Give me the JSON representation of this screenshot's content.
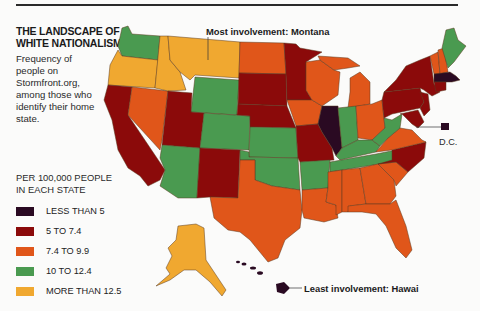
{
  "header": {
    "title_line1": "THE LANDSCAPE OF",
    "title_line2": "WHITE NATIONALISM",
    "subtitle": "Frequency of people on Stormfront.org, among those who identify their home state."
  },
  "legend": {
    "heading_line1": "PER 100,000 PEOPLE",
    "heading_line2": "IN EACH STATE",
    "items": [
      {
        "label": "LESS THAN 5",
        "color": "#2a0a22"
      },
      {
        "label": "5 TO 7.4",
        "color": "#8b0a0a"
      },
      {
        "label": "7.4 TO 9.9",
        "color": "#e0561a"
      },
      {
        "label": "10 TO 12.4",
        "color": "#4a9a50"
      },
      {
        "label": "MORE THAN 12.5",
        "color": "#f0a830"
      }
    ]
  },
  "annotations": {
    "most": "Most involvement: Montana",
    "least": "Least involvement: Hawai",
    "dc": "D.C."
  },
  "colors": {
    "lt5": "#2a0a22",
    "c5_7": "#8b0a0a",
    "c7_9": "#e0561a",
    "c10_12": "#4a9a50",
    "gt12": "#f0a830"
  },
  "states": {
    "WA": "10 TO 12.4",
    "OR": "MORE THAN 12.5",
    "CA": "5 TO 7.4",
    "NV": "7.4 TO 9.9",
    "ID": "MORE THAN 12.5",
    "MT": "MORE THAN 12.5",
    "WY": "10 TO 12.4",
    "UT": "5 TO 7.4",
    "AZ": "10 TO 12.4",
    "CO": "10 TO 12.4",
    "NM": "5 TO 7.4",
    "ND": "7.4 TO 9.9",
    "SD": "5 TO 7.4",
    "NE": "5 TO 7.4",
    "KS": "10 TO 12.4",
    "OK": "10 TO 12.4",
    "TX": "7.4 TO 9.9",
    "MN": "5 TO 7.4",
    "IA": "7.4 TO 9.9",
    "MO": "5 TO 7.4",
    "AR": "10 TO 12.4",
    "LA": "7.4 TO 9.9",
    "WI": "7.4 TO 9.9",
    "IL": "LESS THAN 5",
    "MI": "7.4 TO 9.9",
    "IN": "10 TO 12.4",
    "OH": "7.4 TO 9.9",
    "KY": "10 TO 12.4",
    "TN": "10 TO 12.4",
    "MS": "7.4 TO 9.9",
    "AL": "7.4 TO 9.9",
    "GA": "7.4 TO 9.9",
    "FL": "7.4 TO 9.9",
    "SC": "7.4 TO 9.9",
    "NC": "5 TO 7.4",
    "VA": "7.4 TO 9.9",
    "WV": "10 TO 12.4",
    "PA": "5 TO 7.4",
    "NY": "5 TO 7.4",
    "VT": "7.4 TO 9.9",
    "NH": "7.4 TO 9.9",
    "ME": "10 TO 12.4",
    "MA": "LESS THAN 5",
    "CT": "5 TO 7.4",
    "NJ": "5 TO 7.4",
    "DE": "5 TO 7.4",
    "MD": "5 TO 7.4",
    "DC": "LESS THAN 5",
    "AK": "MORE THAN 12.5",
    "HI": "LESS THAN 5"
  }
}
